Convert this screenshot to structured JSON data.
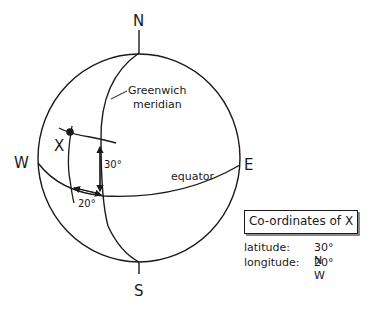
{
  "poles": {
    "north": "N",
    "south": "S",
    "west": "W",
    "east": "E"
  },
  "labels": {
    "greenwich_line1": "Greenwich",
    "greenwich_line2": "meridian",
    "equator": "equator",
    "point": "X",
    "lat_angle": "30°",
    "lon_angle": "20°"
  },
  "legend": {
    "title": "Co-ordinates of X",
    "rows": [
      {
        "key": "latitude:",
        "value": "30° N"
      },
      {
        "key": "longitude:",
        "value": "20° W"
      }
    ]
  },
  "colors": {
    "ink": "#1a1a1a",
    "background": "#ffffff"
  }
}
